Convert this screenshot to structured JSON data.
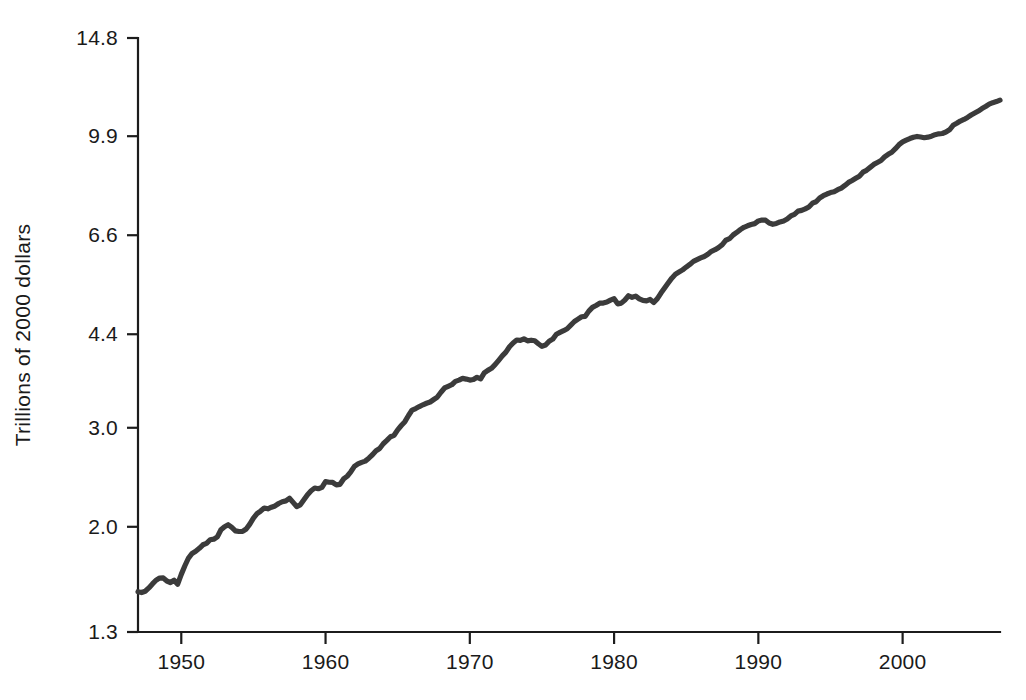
{
  "chart_data": {
    "type": "line",
    "title": "",
    "xlabel": "",
    "ylabel": "Trillions of 2000 dollars",
    "scale_y": "log",
    "grid": false,
    "legend": "none",
    "xlim": [
      1947,
      2006.75
    ],
    "ylim": [
      1.3,
      14.8
    ],
    "y_ticks": [
      1.3,
      2.0,
      3.0,
      4.4,
      6.6,
      9.9,
      14.8
    ],
    "y_tick_labels": [
      "1.3",
      "2.0",
      "3.0",
      "4.4",
      "6.6",
      "9.9",
      "14.8"
    ],
    "x_ticks": [
      1950,
      1960,
      1970,
      1980,
      1990,
      2000
    ],
    "x_tick_labels": [
      "1950",
      "1960",
      "1970",
      "1980",
      "1990",
      "2000"
    ],
    "line_color": "#3b3b3b",
    "axis_color": "#1c1c1c",
    "background_color": "#ffffff",
    "series": [
      {
        "name": "Real GDP",
        "x": [
          1947.0,
          1947.25,
          1947.5,
          1947.75,
          1948.0,
          1948.25,
          1948.5,
          1948.75,
          1949.0,
          1949.25,
          1949.5,
          1949.75,
          1950.0,
          1950.25,
          1950.5,
          1950.75,
          1951.0,
          1951.25,
          1951.5,
          1951.75,
          1952.0,
          1952.25,
          1952.5,
          1952.75,
          1953.0,
          1953.25,
          1953.5,
          1953.75,
          1954.0,
          1954.25,
          1954.5,
          1954.75,
          1955.0,
          1955.25,
          1955.5,
          1955.75,
          1956.0,
          1956.25,
          1956.5,
          1956.75,
          1957.0,
          1957.25,
          1957.5,
          1957.75,
          1958.0,
          1958.25,
          1958.5,
          1958.75,
          1959.0,
          1959.25,
          1959.5,
          1959.75,
          1960.0,
          1960.25,
          1960.5,
          1960.75,
          1961.0,
          1961.25,
          1961.5,
          1961.75,
          1962.0,
          1962.25,
          1962.5,
          1962.75,
          1963.0,
          1963.25,
          1963.5,
          1963.75,
          1964.0,
          1964.25,
          1964.5,
          1964.75,
          1965.0,
          1965.25,
          1965.5,
          1965.75,
          1966.0,
          1966.25,
          1966.5,
          1966.75,
          1967.0,
          1967.25,
          1967.5,
          1967.75,
          1968.0,
          1968.25,
          1968.5,
          1968.75,
          1969.0,
          1969.25,
          1969.5,
          1969.75,
          1970.0,
          1970.25,
          1970.5,
          1970.75,
          1971.0,
          1971.25,
          1971.5,
          1971.75,
          1972.0,
          1972.25,
          1972.5,
          1972.75,
          1973.0,
          1973.25,
          1973.5,
          1973.75,
          1974.0,
          1974.25,
          1974.5,
          1974.75,
          1975.0,
          1975.25,
          1975.5,
          1975.75,
          1976.0,
          1976.25,
          1976.5,
          1976.75,
          1977.0,
          1977.25,
          1977.5,
          1977.75,
          1978.0,
          1978.25,
          1978.5,
          1978.75,
          1979.0,
          1979.25,
          1979.5,
          1979.75,
          1980.0,
          1980.25,
          1980.5,
          1980.75,
          1981.0,
          1981.25,
          1981.5,
          1981.75,
          1982.0,
          1982.25,
          1982.5,
          1982.75,
          1983.0,
          1983.25,
          1983.5,
          1983.75,
          1984.0,
          1984.25,
          1984.5,
          1984.75,
          1985.0,
          1985.25,
          1985.5,
          1985.75,
          1986.0,
          1986.25,
          1986.5,
          1986.75,
          1987.0,
          1987.25,
          1987.5,
          1987.75,
          1988.0,
          1988.25,
          1988.5,
          1988.75,
          1989.0,
          1989.25,
          1989.5,
          1989.75,
          1990.0,
          1990.25,
          1990.5,
          1990.75,
          1991.0,
          1991.25,
          1991.5,
          1991.75,
          1992.0,
          1992.25,
          1992.5,
          1992.75,
          1993.0,
          1993.25,
          1993.5,
          1993.75,
          1994.0,
          1994.25,
          1994.5,
          1994.75,
          1995.0,
          1995.25,
          1995.5,
          1995.75,
          1996.0,
          1996.25,
          1996.5,
          1996.75,
          1997.0,
          1997.25,
          1997.5,
          1997.75,
          1998.0,
          1998.25,
          1998.5,
          1998.75,
          1999.0,
          1999.25,
          1999.5,
          1999.75,
          2000.0,
          2000.25,
          2000.5,
          2000.75,
          2001.0,
          2001.25,
          2001.5,
          2001.75,
          2002.0,
          2002.25,
          2002.5,
          2002.75,
          2003.0,
          2003.25,
          2003.5,
          2003.75,
          2004.0,
          2004.25,
          2004.5,
          2004.75,
          2005.0,
          2005.25,
          2005.5,
          2005.75,
          2006.0,
          2006.25,
          2006.5,
          2006.75
        ],
        "values": [
          1.533,
          1.528,
          1.536,
          1.557,
          1.583,
          1.607,
          1.621,
          1.622,
          1.602,
          1.592,
          1.607,
          1.581,
          1.646,
          1.705,
          1.76,
          1.793,
          1.809,
          1.831,
          1.858,
          1.869,
          1.897,
          1.901,
          1.919,
          1.976,
          2.001,
          2.017,
          1.995,
          1.967,
          1.962,
          1.962,
          1.982,
          2.022,
          2.072,
          2.11,
          2.133,
          2.16,
          2.153,
          2.167,
          2.178,
          2.2,
          2.216,
          2.224,
          2.248,
          2.21,
          2.173,
          2.188,
          2.234,
          2.281,
          2.318,
          2.344,
          2.337,
          2.35,
          2.406,
          2.4,
          2.398,
          2.375,
          2.38,
          2.433,
          2.46,
          2.505,
          2.561,
          2.587,
          2.604,
          2.617,
          2.649,
          2.686,
          2.731,
          2.756,
          2.81,
          2.849,
          2.892,
          2.909,
          2.975,
          3.028,
          3.076,
          3.155,
          3.226,
          3.246,
          3.272,
          3.296,
          3.317,
          3.334,
          3.368,
          3.402,
          3.47,
          3.531,
          3.555,
          3.578,
          3.628,
          3.646,
          3.672,
          3.662,
          3.647,
          3.655,
          3.689,
          3.666,
          3.755,
          3.795,
          3.827,
          3.884,
          3.954,
          4.027,
          4.089,
          4.181,
          4.246,
          4.297,
          4.29,
          4.317,
          4.283,
          4.294,
          4.284,
          4.232,
          4.188,
          4.209,
          4.276,
          4.313,
          4.4,
          4.433,
          4.464,
          4.5,
          4.567,
          4.635,
          4.68,
          4.727,
          4.735,
          4.837,
          4.912,
          4.95,
          4.996,
          4.999,
          5.02,
          5.06,
          5.09,
          4.983,
          4.998,
          5.062,
          5.151,
          5.118,
          5.143,
          5.085,
          5.053,
          5.044,
          5.073,
          5.012,
          5.09,
          5.208,
          5.318,
          5.427,
          5.536,
          5.625,
          5.675,
          5.728,
          5.794,
          5.856,
          5.93,
          5.972,
          6.014,
          6.05,
          6.106,
          6.179,
          6.219,
          6.277,
          6.35,
          6.466,
          6.506,
          6.606,
          6.675,
          6.753,
          6.818,
          6.86,
          6.896,
          6.921,
          6.997,
          7.022,
          7.019,
          6.938,
          6.902,
          6.925,
          6.969,
          6.998,
          7.055,
          7.143,
          7.19,
          7.286,
          7.306,
          7.351,
          7.41,
          7.525,
          7.57,
          7.689,
          7.76,
          7.813,
          7.859,
          7.885,
          7.951,
          8.004,
          8.093,
          8.194,
          8.259,
          8.333,
          8.406,
          8.545,
          8.609,
          8.713,
          8.821,
          8.89,
          8.962,
          9.096,
          9.192,
          9.269,
          9.408,
          9.562,
          9.672,
          9.741,
          9.805,
          9.858,
          9.89,
          9.865,
          9.838,
          9.86,
          9.899,
          9.96,
          9.997,
          10.011,
          10.071,
          10.164,
          10.351,
          10.437,
          10.534,
          10.603,
          10.692,
          10.797,
          10.885,
          10.975,
          11.087,
          11.179,
          11.288,
          11.358,
          11.407,
          11.476
        ]
      }
    ],
    "annotations": []
  },
  "axis": {
    "y_label": "Trillions of 2000 dollars"
  }
}
